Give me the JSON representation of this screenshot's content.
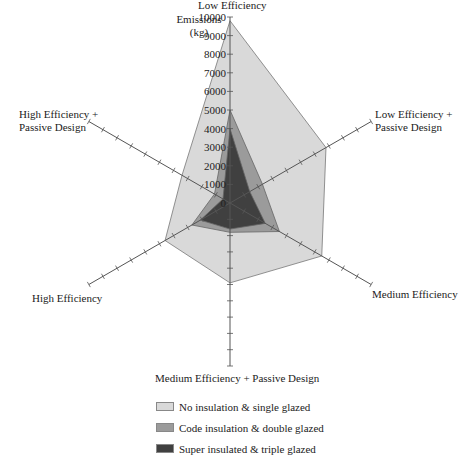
{
  "chart_data": {
    "type": "radar",
    "title": "",
    "ylabel": "Emissions (kg)",
    "ylabel_lines": [
      "Emissions",
      "(kg)"
    ],
    "rlim": [
      0,
      10000
    ],
    "rticks": [
      0,
      1000,
      2000,
      3000,
      4000,
      5000,
      6000,
      7000,
      8000,
      9000,
      10000
    ],
    "categories": [
      "Low Efficiency",
      "Low Efficiency + Passive Design",
      "Medium Efficiency",
      "Medium Efficiency + Passive Design",
      "High Efficiency",
      "High Efficiency + Passive Design"
    ],
    "series": [
      {
        "name": "No insulation & single glazed",
        "color": "#d9d9d9",
        "values": [
          9800,
          6800,
          6500,
          4900,
          4600,
          3400
        ]
      },
      {
        "name": "Code insulation & double glazed",
        "color": "#9b9b9b",
        "values": [
          5000,
          2300,
          3500,
          1800,
          2700,
          1100
        ]
      },
      {
        "name": "Super insulated & triple glazed",
        "color": "#404040",
        "values": [
          4000,
          1400,
          2500,
          1600,
          2100,
          500
        ]
      }
    ],
    "legend_position": "bottom",
    "grid": false
  },
  "labels": {
    "axis_top": "Low Efficiency",
    "axis_top_right": [
      "Low Efficiency +",
      "Passive Design"
    ],
    "axis_bottom_right": "Medium Efficiency",
    "axis_bottom": "Medium Efficiency + Passive Design",
    "axis_bottom_left": "High Efficiency",
    "axis_top_left": [
      "High Efficiency +",
      "Passive Design"
    ],
    "ylabel_1": "Emissions",
    "ylabel_2": "(kg)"
  },
  "legend": [
    {
      "label": "No insulation & single glazed",
      "color": "#d9d9d9"
    },
    {
      "label": "Code insulation & double glazed",
      "color": "#9b9b9b"
    },
    {
      "label": "Super insulated & triple glazed",
      "color": "#404040"
    }
  ]
}
